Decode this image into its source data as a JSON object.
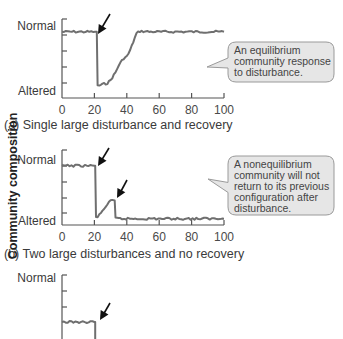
{
  "chart_data": [
    {
      "type": "line",
      "panel": "a",
      "caption": "(a) Single large disturbance and recovery",
      "xlabel": "",
      "ylabel": "Community composition",
      "xlim": [
        0,
        100
      ],
      "xticks": [
        "0",
        "20",
        "40",
        "60",
        "80",
        "100"
      ],
      "ylim": [
        0,
        1
      ],
      "ycategories": {
        "top": "Normal",
        "bottom": "Altered"
      },
      "disturbances_at": [
        21
      ],
      "callout": [
        "An equilibrium",
        "community response",
        "to disturbance."
      ],
      "series": [
        {
          "name": "community composition",
          "x": [
            0,
            20.5,
            21.5,
            22,
            25,
            28,
            30,
            33,
            35,
            38,
            40,
            42,
            44,
            46,
            48,
            55,
            60,
            70,
            80,
            90,
            100
          ],
          "y": [
            0.97,
            0.97,
            0.97,
            0.05,
            0.08,
            0.1,
            0.15,
            0.28,
            0.4,
            0.52,
            0.55,
            0.65,
            0.8,
            0.94,
            0.98,
            0.97,
            0.97,
            0.97,
            0.97,
            0.97,
            0.97
          ]
        }
      ]
    },
    {
      "type": "line",
      "panel": "b",
      "caption": "(b) Two large disturbances and no recovery",
      "xlim": [
        0,
        100
      ],
      "xticks": [
        "0",
        "20",
        "40",
        "60",
        "80",
        "100"
      ],
      "ylim": [
        0,
        1
      ],
      "ycategories": {
        "top": "Normal",
        "bottom": "Altered"
      },
      "disturbances_at": [
        20.5,
        32.5
      ],
      "callout": [
        "A nonequilibrium",
        "community will not",
        "return to its previous",
        "configuration after",
        "disturbance."
      ],
      "series": [
        {
          "name": "community composition",
          "x": [
            0,
            20,
            20.5,
            21,
            23,
            26,
            29,
            31,
            32.5,
            33,
            36,
            50,
            70,
            90,
            100
          ],
          "y": [
            0.97,
            0.97,
            0.97,
            0.06,
            0.1,
            0.22,
            0.32,
            0.37,
            0.36,
            0.05,
            0.04,
            0.04,
            0.04,
            0.04,
            0.04
          ]
        }
      ]
    },
    {
      "type": "line",
      "panel": "c",
      "partial": true,
      "ycategories": {
        "top": "Normal"
      },
      "disturbances_at": [
        20.5
      ],
      "series": [
        {
          "name": "community composition",
          "x": [
            0,
            20,
            20.5
          ],
          "y": [
            0.38,
            0.38,
            0.38
          ]
        }
      ]
    }
  ]
}
